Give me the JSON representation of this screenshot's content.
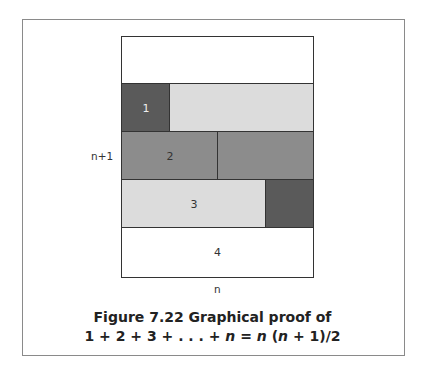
{
  "figure": {
    "side_label_left": "n+1",
    "bottom_label": "n",
    "caption_line1": "Figure 7.22  Graphical proof of",
    "caption_line2_parts": [
      "1 + 2 + 3 + . . . + ",
      "n",
      " = ",
      "n",
      " (",
      "n",
      " + 1)/2"
    ],
    "rows": [
      {
        "label": "",
        "fill": "#ffffff",
        "split": 0
      },
      {
        "label": "1",
        "fill": "#5a5a5a",
        "rest_fill": "#dcdcdc",
        "split": 1
      },
      {
        "label": "2",
        "fill": "#8c8c8c",
        "rest_fill": "#8c8c8c",
        "split": 2
      },
      {
        "label": "3",
        "fill": "#dcdcdc",
        "rest_fill": "#5a5a5a",
        "split": 3
      },
      {
        "label": "4",
        "fill": "#ffffff",
        "split": 4
      }
    ],
    "colors": {
      "dark": "#5a5a5a",
      "medium": "#8c8c8c",
      "light": "#dcdcdc",
      "white": "#ffffff",
      "border": "#333333"
    }
  }
}
